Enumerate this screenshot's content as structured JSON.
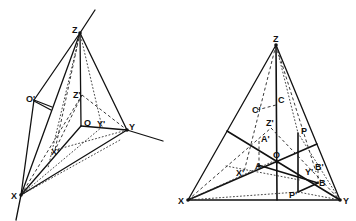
{
  "figures": [
    {
      "name": "trihedral-axes-perspective",
      "labels": {
        "Z": "Z",
        "X": "X",
        "Y": "Y",
        "O": "O",
        "O_prime": "O'",
        "Z_prime": "Z'",
        "X_prime": "X'",
        "Y_prime": "Y'"
      }
    },
    {
      "name": "trace-triangle-construction",
      "labels": {
        "Z": "Z",
        "X": "X",
        "Y": "Y",
        "O": "O",
        "A": "A",
        "A_prime": "A'",
        "B": "B",
        "B_prime": "B'",
        "C": "C",
        "C_prime": "C'",
        "P": "P",
        "P_prime": "P'",
        "X_prime": "X'",
        "Y_prime": "Y'",
        "Z_prime": "Z'"
      }
    }
  ]
}
